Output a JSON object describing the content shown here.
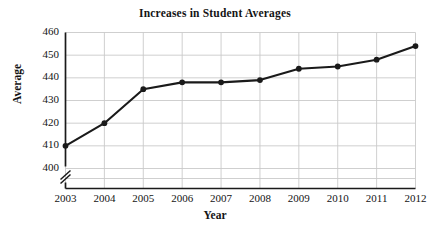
{
  "chart_data": {
    "type": "line",
    "title": "Increases in Student Averages",
    "xlabel": "Year",
    "ylabel": "Average",
    "categories": [
      "2003",
      "2004",
      "2005",
      "2006",
      "2007",
      "2008",
      "2009",
      "2010",
      "2011",
      "2012"
    ],
    "values": [
      410,
      420,
      435,
      438,
      438,
      439,
      444,
      445,
      448,
      454
    ],
    "series": [
      {
        "name": "Student Average",
        "values": [
          410,
          420,
          435,
          438,
          438,
          439,
          444,
          445,
          448,
          454
        ]
      }
    ],
    "x": [
      2003,
      2004,
      2005,
      2006,
      2007,
      2008,
      2009,
      2010,
      2011,
      2012
    ],
    "ylim": [
      400,
      460
    ],
    "ytick_labels": [
      "460",
      "450",
      "440",
      "430",
      "420",
      "410",
      "400"
    ],
    "ytick_values": [
      460,
      450,
      440,
      430,
      420,
      410,
      400
    ],
    "xtick_labels": [
      "2003",
      "2004",
      "2005",
      "2006",
      "2007",
      "2008",
      "2009",
      "2010",
      "2011",
      "2012"
    ],
    "grid": true,
    "grid_color": "#c9c9c9",
    "legend": "none",
    "axis_break": true,
    "axis_break_note": "y-axis broken below 400",
    "line_color": "#1a1a1a",
    "marker": "circle",
    "marker_color": "#1a1a1a",
    "background": "#ffffff"
  },
  "icons": {
    "axis_break": "axis-break-zigzag-icon"
  }
}
